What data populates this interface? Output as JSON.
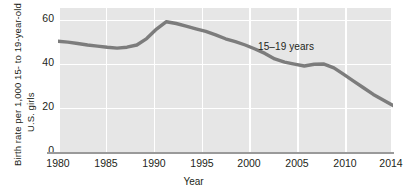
{
  "chart_data": {
    "type": "line",
    "title": "",
    "xlabel": "Year",
    "ylabel_line1": "Birth rate per 1,000 15- to 19-year-old",
    "ylabel_line2": "U.S. girls",
    "series_name": "15–19 years",
    "annotation": "15–19 years",
    "grid": true,
    "legend_position": "inline-annotation",
    "xlim": [
      1980,
      2014
    ],
    "ylim": [
      0,
      65
    ],
    "yticks": [
      60,
      40,
      20,
      0
    ],
    "ytick_labels": [
      "60",
      "40",
      "20",
      "0"
    ],
    "xticks": [
      1980,
      1985,
      1990,
      1995,
      2000,
      2005,
      2010,
      2014
    ],
    "xtick_labels": [
      "1980",
      "1985",
      "1990",
      "1995",
      "2000",
      "2005",
      "2010",
      "2014"
    ],
    "line_color": "#7c7c7c",
    "plot_background": "#e6e6e6",
    "gridline_color": "#ffffff",
    "x": [
      1980,
      1981,
      1982,
      1983,
      1984,
      1985,
      1986,
      1987,
      1988,
      1989,
      1990,
      1991,
      1992,
      1993,
      1994,
      1995,
      1996,
      1997,
      1998,
      1999,
      2000,
      2001,
      2002,
      2003,
      2004,
      2005,
      2006,
      2007,
      2008,
      2009,
      2010,
      2011,
      2012,
      2013,
      2014
    ],
    "values": [
      50.0,
      49.6,
      49.0,
      48.3,
      47.8,
      47.3,
      46.9,
      47.3,
      48.3,
      51.2,
      55.5,
      58.8,
      58.0,
      56.8,
      55.6,
      54.4,
      52.9,
      51.1,
      49.8,
      48.3,
      46.5,
      44.5,
      42.0,
      40.6,
      39.7,
      38.8,
      39.6,
      39.7,
      38.0,
      35.0,
      32.0,
      29.0,
      26.0,
      23.5,
      21.0
    ],
    "value_units": "births per 1,000 girls aged 15–19"
  }
}
